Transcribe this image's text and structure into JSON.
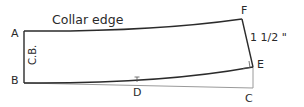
{
  "diagram": {
    "title": "Collar edge",
    "points": {
      "A": "A",
      "B": "B",
      "C": "C",
      "D": "D",
      "E": "E",
      "F": "F"
    },
    "center_back_label": "C.B.",
    "measurement": "1 1/2 \"",
    "colors": {
      "outline": "#2b2b2b",
      "guide": "#9a9a9a"
    }
  }
}
